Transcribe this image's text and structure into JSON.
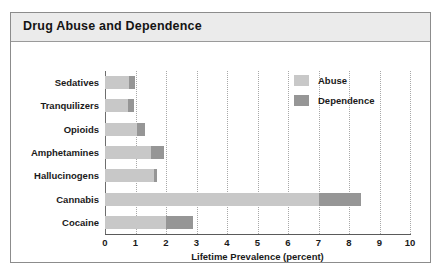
{
  "figure": {
    "title": "Drug Abuse and Dependence"
  },
  "chart_data": {
    "type": "bar",
    "orientation": "horizontal",
    "stacked": true,
    "title": "Drug Abuse and Dependence",
    "xlabel": "Lifetime Prevalence (percent)",
    "ylabel": "",
    "xlim": [
      0,
      10
    ],
    "xticks": [
      0,
      1,
      2,
      3,
      4,
      5,
      6,
      7,
      8,
      9,
      10
    ],
    "xticklabels": [
      "0",
      "1",
      "2",
      "3",
      "4",
      "5",
      "6",
      "7",
      "8",
      "9",
      "10"
    ],
    "grid": "vertical-dotted",
    "legend_position": "upper-right-inside",
    "categories": [
      "Sedatives",
      "Tranquilizers",
      "Opioids",
      "Amphetamines",
      "Hallucinogens",
      "Cannabis",
      "Cocaine"
    ],
    "series": [
      {
        "name": "Abuse",
        "color": "#c8c8c8",
        "values": [
          0.8,
          0.75,
          1.05,
          1.5,
          1.6,
          7.0,
          2.0
        ]
      },
      {
        "name": "Dependence",
        "color": "#969696",
        "values": [
          0.2,
          0.2,
          0.25,
          0.45,
          0.1,
          1.4,
          0.9
        ]
      }
    ],
    "totals": [
      1.0,
      0.95,
      1.3,
      1.95,
      1.7,
      8.4,
      2.9
    ]
  },
  "legend": {
    "items": [
      {
        "label": "Abuse",
        "color": "#c8c8c8"
      },
      {
        "label": "Dependence",
        "color": "#969696"
      }
    ]
  },
  "colors": {
    "abuse": "#c8c8c8",
    "dependence": "#969696",
    "title_band": "#ebebeb",
    "frame": "#8c8c8c",
    "axis": "#5a5a5a",
    "gridline": "#a8a8a8"
  }
}
